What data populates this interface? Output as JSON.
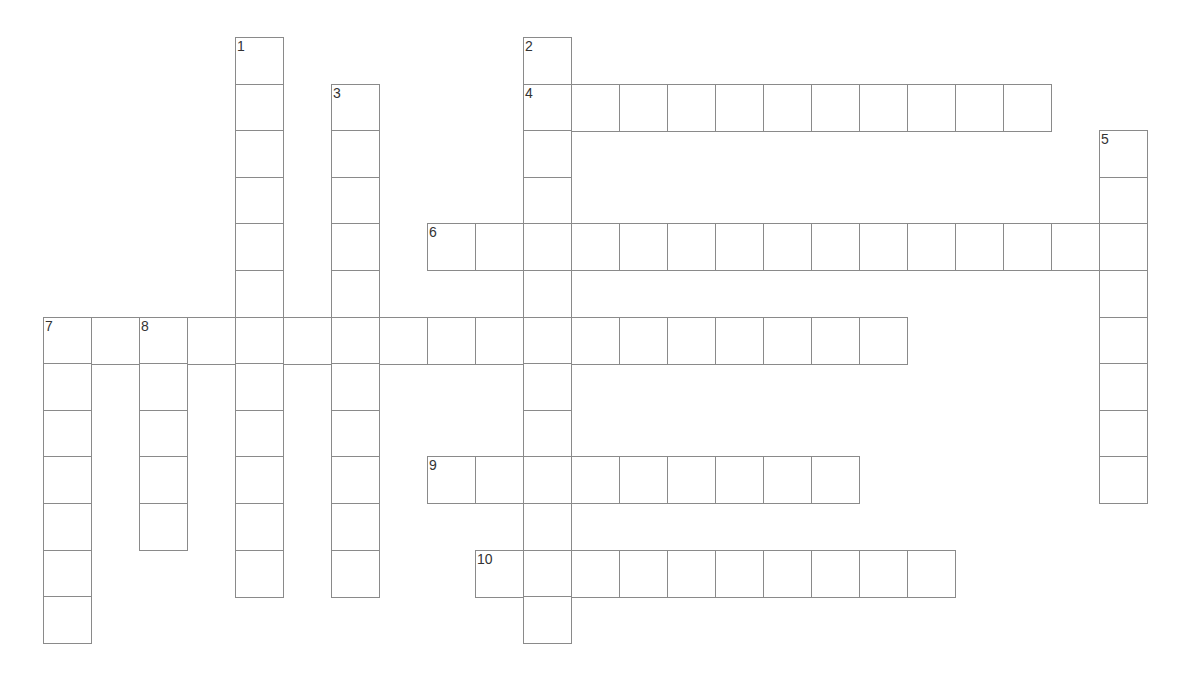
{
  "puzzle": {
    "type": "crossword",
    "grid_origin": {
      "x": 43,
      "y": 37
    },
    "cell_pitch": {
      "x": 48,
      "y": 46.6
    },
    "border_color": "#8a8a8a",
    "entries": [
      {
        "number": "1",
        "direction": "down",
        "row": 0,
        "col": 4,
        "length": 12
      },
      {
        "number": "2",
        "direction": "down",
        "row": 0,
        "col": 10,
        "length": 13
      },
      {
        "number": "3",
        "direction": "down",
        "row": 1,
        "col": 6,
        "length": 11
      },
      {
        "number": "4",
        "direction": "across",
        "row": 1,
        "col": 10,
        "length": 11
      },
      {
        "number": "5",
        "direction": "down",
        "row": 2,
        "col": 22,
        "length": 8
      },
      {
        "number": "6",
        "direction": "across",
        "row": 4,
        "col": 8,
        "length": 15
      },
      {
        "number": "7",
        "direction": "across",
        "row": 6,
        "col": 0,
        "length": 18
      },
      {
        "number": "7",
        "direction": "down",
        "row": 6,
        "col": 0,
        "length": 7
      },
      {
        "number": "8",
        "direction": "down",
        "row": 6,
        "col": 2,
        "length": 5
      },
      {
        "number": "9",
        "direction": "across",
        "row": 9,
        "col": 8,
        "length": 9
      },
      {
        "number": "10",
        "direction": "across",
        "row": 11,
        "col": 9,
        "length": 10
      }
    ]
  }
}
